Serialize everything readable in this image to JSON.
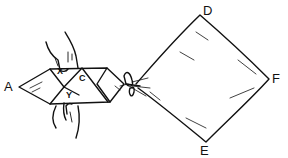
{
  "diagram": {
    "labels": {
      "A": "A",
      "X": "X",
      "C": "C",
      "Y": "Y",
      "D": "D",
      "F": "F",
      "E": "E"
    },
    "colors": {
      "line": "#111111",
      "background": "#ffffff"
    }
  }
}
